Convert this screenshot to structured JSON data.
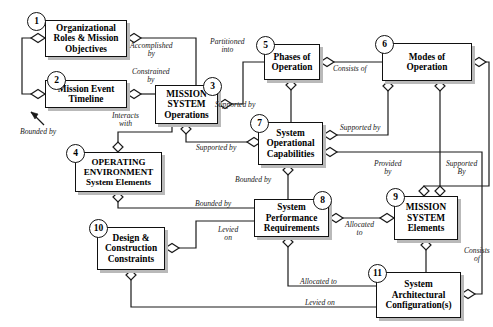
{
  "diagram": {
    "style": {
      "line_color": "#1a1a1a",
      "box_fill": "#ffffff",
      "box_border": "#111111",
      "shadow": "#b9b9b9",
      "text_color": "#000000"
    },
    "nodes": [
      {
        "id": "1",
        "badge": "1",
        "lines": [
          "Organizational",
          "Roles & Mission",
          "Objectives"
        ],
        "x": 45,
        "y": 20,
        "w": 82,
        "h": 37,
        "font": 9.3
      },
      {
        "id": "2",
        "badge": "2",
        "lines": [
          "Mission Event",
          "Timeline"
        ],
        "x": 45,
        "y": 80,
        "w": 82,
        "h": 28,
        "font": 9.3
      },
      {
        "id": "3",
        "badge": "3",
        "lines": [
          "MISSION",
          "SYSTEM",
          "Operations"
        ],
        "x": 155,
        "y": 85,
        "w": 63,
        "h": 39,
        "font": 9.3
      },
      {
        "id": "4",
        "badge": "4",
        "lines": [
          "OPERATING",
          "ENVIRONMENT",
          "System Elements"
        ],
        "x": 75,
        "y": 152,
        "w": 87,
        "h": 40,
        "font": 9.0
      },
      {
        "id": "5",
        "badge": "5",
        "lines": [
          "Phases of",
          "Operation"
        ],
        "x": 264,
        "y": 44,
        "w": 56,
        "h": 36,
        "font": 9.3
      },
      {
        "id": "6",
        "badge": "6",
        "lines": [
          "Modes of",
          "Operation"
        ],
        "x": 382,
        "y": 43,
        "w": 90,
        "h": 38,
        "font": 9.3
      },
      {
        "id": "7",
        "badge": "7",
        "lines": [
          "System",
          "Operational",
          "Capabilities"
        ],
        "x": 258,
        "y": 122,
        "w": 65,
        "h": 43,
        "font": 9.3
      },
      {
        "id": "8",
        "badge": "8",
        "lines": [
          "System",
          "Performance",
          "Requirements"
        ],
        "x": 254,
        "y": 199,
        "w": 75,
        "h": 38,
        "font": 9.3
      },
      {
        "id": "9",
        "badge": "9",
        "lines": [
          "MISSION",
          "SYSTEM",
          "Elements"
        ],
        "x": 394,
        "y": 196,
        "w": 64,
        "h": 44,
        "font": 9.3
      },
      {
        "id": "10",
        "badge": "10",
        "lines": [
          "Design &",
          "Construction",
          "Constraints"
        ],
        "x": 97,
        "y": 227,
        "w": 68,
        "h": 43,
        "font": 9.3
      },
      {
        "id": "11",
        "badge": "11",
        "lines": [
          "System",
          "Architectural",
          "Configuration(s)"
        ],
        "x": 376,
        "y": 272,
        "w": 85,
        "h": 46,
        "font": 9.3
      }
    ],
    "edge_labels": [
      {
        "name": "accomplished-by",
        "text": [
          "Accomplished",
          "by"
        ],
        "x": 130,
        "y": 42
      },
      {
        "name": "constrained-by",
        "text": [
          "Constrained",
          "by"
        ],
        "x": 130,
        "y": 71
      },
      {
        "name": "bounded-by-left",
        "text": [
          "Bounded by"
        ],
        "x": 20,
        "y": 128
      },
      {
        "name": "interacts-with",
        "text": [
          "Interacts",
          "with"
        ],
        "x": 112,
        "y": 115
      },
      {
        "name": "partitioned-into",
        "text": [
          "Partitioned",
          "into"
        ],
        "x": 210,
        "y": 41
      },
      {
        "name": "consists-of-5-6",
        "text": [
          "Consists of"
        ],
        "x": 333,
        "y": 66
      },
      {
        "name": "supported-by-5-7",
        "text": [
          "Supported by"
        ],
        "x": 250,
        "y": 104
      },
      {
        "name": "supported-by-7-6",
        "text": [
          "Supported by"
        ],
        "x": 345,
        "y": 122
      },
      {
        "name": "supported-by-3-7",
        "text": [
          "Supported by"
        ],
        "x": 200,
        "y": 146
      },
      {
        "name": "provided-by",
        "text": [
          "Provided",
          "by"
        ],
        "x": 380,
        "y": 165
      },
      {
        "name": "supported-by-right",
        "text": [
          "Supported",
          "By"
        ],
        "x": 455,
        "y": 165
      },
      {
        "name": "bounded-by-7-8",
        "text": [
          "Bounded by"
        ],
        "x": 248,
        "y": 180
      },
      {
        "name": "bounded-by-4-8",
        "text": [
          "Bounded by"
        ],
        "x": 200,
        "y": 200
      },
      {
        "name": "levied-on-10",
        "text": [
          "Levied",
          "on"
        ],
        "x": 222,
        "y": 228
      },
      {
        "name": "allocated-to-8-9",
        "text": [
          "Allocated",
          "to"
        ],
        "x": 362,
        "y": 221
      },
      {
        "name": "consists-of-9-11",
        "text": [
          "Consists",
          "of"
        ],
        "x": 475,
        "y": 250
      },
      {
        "name": "allocated-to-8-11",
        "text": [
          "Allocated to"
        ],
        "x": 322,
        "y": 280
      },
      {
        "name": "levied-on-10-11",
        "text": [
          "Levied on"
        ],
        "x": 323,
        "y": 302
      }
    ]
  }
}
